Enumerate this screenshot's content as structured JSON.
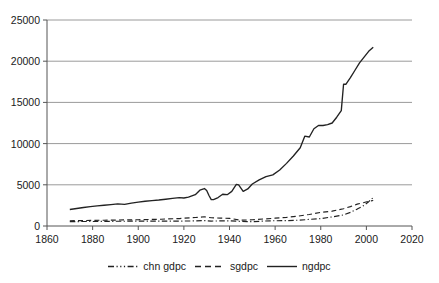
{
  "chart_data": {
    "type": "line",
    "title": "",
    "xlabel": "",
    "ylabel": "",
    "xlim": [
      1860,
      2020
    ],
    "ylim": [
      0,
      25000
    ],
    "grid": "horizontal",
    "legend_position": "bottom",
    "xticks": [
      1860,
      1880,
      1900,
      1920,
      1940,
      1960,
      1980,
      2000,
      2020
    ],
    "yticks": [
      0,
      5000,
      10000,
      15000,
      20000,
      25000
    ],
    "xtick_labels": [
      "1860",
      "1880",
      "1900",
      "1920",
      "1940",
      "1960",
      "1980",
      "2000",
      "2020"
    ],
    "ytick_labels": [
      "0",
      "5000",
      "10000",
      "15000",
      "20000",
      "25000"
    ],
    "series": [
      {
        "name": "chn gdpc",
        "style": "dash-dot",
        "color": "#222222",
        "x": [
          1870,
          1875,
          1880,
          1885,
          1890,
          1895,
          1900,
          1905,
          1910,
          1913,
          1918,
          1920,
          1925,
          1929,
          1932,
          1936,
          1940,
          1945,
          1950,
          1955,
          1960,
          1965,
          1970,
          1975,
          1980,
          1985,
          1990,
          1993,
          1996,
          1999,
          2001,
          2003
        ],
        "values": [
          530,
          540,
          550,
          560,
          570,
          580,
          585,
          590,
          595,
          600,
          590,
          600,
          620,
          660,
          600,
          620,
          620,
          560,
          520,
          600,
          640,
          650,
          700,
          800,
          900,
          1100,
          1350,
          1650,
          2050,
          2500,
          2950,
          3450
        ]
      },
      {
        "name": "sgdpc",
        "style": "dashed",
        "color": "#222222",
        "x": [
          1870,
          1875,
          1880,
          1885,
          1890,
          1895,
          1900,
          1905,
          1910,
          1913,
          1918,
          1920,
          1925,
          1929,
          1932,
          1936,
          1940,
          1945,
          1950,
          1955,
          1960,
          1965,
          1970,
          1975,
          1980,
          1985,
          1990,
          1993,
          1996,
          1999,
          2001,
          2003
        ],
        "values": [
          640,
          660,
          680,
          700,
          720,
          740,
          760,
          790,
          820,
          860,
          900,
          950,
          1030,
          1120,
          1000,
          960,
          930,
          700,
          760,
          850,
          950,
          1050,
          1200,
          1400,
          1650,
          1800,
          2100,
          2350,
          2650,
          2850,
          3000,
          3100
        ]
      },
      {
        "name": "ngdpc",
        "style": "solid",
        "color": "#222222",
        "x": [
          1870,
          1873,
          1876,
          1879,
          1882,
          1885,
          1888,
          1891,
          1894,
          1897,
          1900,
          1903,
          1906,
          1909,
          1912,
          1915,
          1918,
          1920,
          1922,
          1925,
          1927,
          1929,
          1930,
          1931,
          1932,
          1933,
          1935,
          1937,
          1939,
          1941,
          1943,
          1944,
          1946,
          1948,
          1950,
          1953,
          1956,
          1959,
          1962,
          1965,
          1968,
          1971,
          1973,
          1975,
          1977,
          1979,
          1981,
          1983,
          1985,
          1987,
          1989,
          1990,
          1991,
          1993,
          1995,
          1997,
          1999,
          2001,
          2003
        ],
        "values": [
          2000,
          2120,
          2250,
          2350,
          2450,
          2520,
          2600,
          2680,
          2620,
          2780,
          2900,
          3000,
          3080,
          3150,
          3250,
          3350,
          3450,
          3400,
          3500,
          3800,
          4350,
          4550,
          4300,
          3700,
          3200,
          3200,
          3450,
          3850,
          3800,
          4200,
          5050,
          5000,
          4200,
          4500,
          5100,
          5600,
          6000,
          6200,
          6800,
          7600,
          8500,
          9500,
          10900,
          10800,
          11800,
          12200,
          12200,
          12300,
          12500,
          13200,
          14000,
          17200,
          17200,
          18000,
          18900,
          19800,
          20500,
          21200,
          21700
        ]
      }
    ]
  },
  "axes": {
    "y_axis_name": "y-axis",
    "x_axis_name": "x-axis"
  },
  "legend": {
    "items": [
      {
        "label": "chn gdpc",
        "style": "dash-dot"
      },
      {
        "label": "sgdpc",
        "style": "dashed"
      },
      {
        "label": "ngdpc",
        "style": "solid"
      }
    ]
  },
  "colors": {
    "line": "#222222",
    "grid": "#9a9a9a",
    "axis": "#555555",
    "text": "#1a1a1a",
    "background": "#ffffff"
  }
}
